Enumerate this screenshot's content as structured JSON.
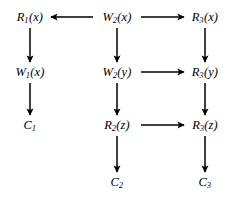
{
  "diagram": {
    "type": "directed-graph",
    "title": "",
    "background_color": "#ffffff",
    "edge_color": "#000000",
    "text_color": "#000000",
    "columns": [
      {
        "id": "col1",
        "x": 30
      },
      {
        "id": "col2",
        "x": 117
      },
      {
        "id": "col3",
        "x": 205
      }
    ],
    "rows": [
      {
        "id": "row1",
        "y": 17
      },
      {
        "id": "row2",
        "y": 72
      },
      {
        "id": "row3",
        "y": 125
      },
      {
        "id": "row4",
        "y": 182
      }
    ],
    "nodes": [
      {
        "id": "n_r1x",
        "base": "R",
        "sub": "1",
        "arg": "(x)",
        "label": "R1(x)",
        "x": 30,
        "y": 17
      },
      {
        "id": "n_w2x",
        "base": "W",
        "sub": "2",
        "arg": "(x)",
        "label": "W2(x)",
        "x": 117,
        "y": 17
      },
      {
        "id": "n_r3x",
        "base": "R",
        "sub": "3",
        "arg": "(x)",
        "label": "R3(x)",
        "x": 205,
        "y": 17
      },
      {
        "id": "n_w1x",
        "base": "W",
        "sub": "1",
        "arg": "(x)",
        "label": "W1(x)",
        "x": 30,
        "y": 72
      },
      {
        "id": "n_w2y",
        "base": "W",
        "sub": "2",
        "arg": "(y)",
        "label": "W2(y)",
        "x": 117,
        "y": 72
      },
      {
        "id": "n_r3y",
        "base": "R",
        "sub": "3",
        "arg": "(y)",
        "label": "R3(y)",
        "x": 205,
        "y": 72
      },
      {
        "id": "n_c1",
        "base": "C",
        "sub": "1",
        "arg": "",
        "label": "C1",
        "x": 30,
        "y": 125
      },
      {
        "id": "n_r2z",
        "base": "R",
        "sub": "2",
        "arg": "(z)",
        "label": "R2(z)",
        "x": 117,
        "y": 125
      },
      {
        "id": "n_r3z",
        "base": "R",
        "sub": "3",
        "arg": "(z)",
        "label": "R3(z)",
        "x": 205,
        "y": 125
      },
      {
        "id": "n_c2",
        "base": "C",
        "sub": "2",
        "arg": "",
        "label": "C2",
        "x": 117,
        "y": 182
      },
      {
        "id": "n_c3",
        "base": "C",
        "sub": "3",
        "arg": "",
        "label": "C3",
        "x": 205,
        "y": 182
      }
    ],
    "edges": [
      {
        "id": "e_w2x_r1x",
        "from": "n_w2x",
        "to": "n_r1x",
        "direction": "left",
        "x1": 93,
        "y1": 17,
        "x2": 51,
        "y2": 17
      },
      {
        "id": "e_w2x_r3x",
        "from": "n_w2x",
        "to": "n_r3x",
        "direction": "right",
        "x1": 141,
        "y1": 17,
        "x2": 184,
        "y2": 17
      },
      {
        "id": "e_w2y_r3y",
        "from": "n_w2y",
        "to": "n_r3y",
        "direction": "right",
        "x1": 141,
        "y1": 72,
        "x2": 184,
        "y2": 72
      },
      {
        "id": "e_r2z_r3z",
        "from": "n_r2z",
        "to": "n_r3z",
        "direction": "right",
        "x1": 141,
        "y1": 125,
        "x2": 184,
        "y2": 125
      },
      {
        "id": "e_r1x_w1x",
        "from": "n_r1x",
        "to": "n_w1x",
        "direction": "down",
        "x1": 30,
        "y1": 28,
        "x2": 30,
        "y2": 62
      },
      {
        "id": "e_w1x_c1",
        "from": "n_w1x",
        "to": "n_c1",
        "direction": "down",
        "x1": 30,
        "y1": 83,
        "x2": 30,
        "y2": 115
      },
      {
        "id": "e_w2x_w2y",
        "from": "n_w2x",
        "to": "n_w2y",
        "direction": "down",
        "x1": 117,
        "y1": 28,
        "x2": 117,
        "y2": 62
      },
      {
        "id": "e_w2y_r2z",
        "from": "n_w2y",
        "to": "n_r2z",
        "direction": "down",
        "x1": 117,
        "y1": 83,
        "x2": 117,
        "y2": 115
      },
      {
        "id": "e_r2z_c2",
        "from": "n_r2z",
        "to": "n_c2",
        "direction": "down",
        "x1": 117,
        "y1": 136,
        "x2": 117,
        "y2": 172
      },
      {
        "id": "e_r3x_r3y",
        "from": "n_r3x",
        "to": "n_r3y",
        "direction": "down",
        "x1": 205,
        "y1": 28,
        "x2": 205,
        "y2": 62
      },
      {
        "id": "e_r3y_r3z",
        "from": "n_r3y",
        "to": "n_r3z",
        "direction": "down",
        "x1": 205,
        "y1": 83,
        "x2": 205,
        "y2": 115
      },
      {
        "id": "e_r3z_c3",
        "from": "n_r3z",
        "to": "n_c3",
        "direction": "down",
        "x1": 205,
        "y1": 136,
        "x2": 205,
        "y2": 172
      }
    ]
  }
}
